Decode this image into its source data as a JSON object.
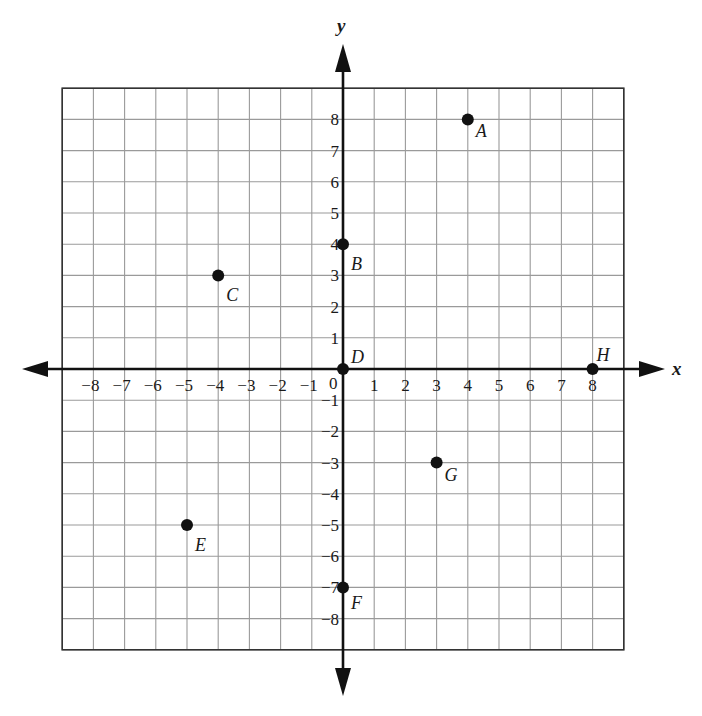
{
  "chart_data": {
    "type": "scatter",
    "title": "",
    "xlabel": "x",
    "ylabel": "y",
    "xlim": [
      -9,
      9
    ],
    "ylim": [
      -9,
      9
    ],
    "grid": true,
    "x_ticks": [
      -8,
      -7,
      -6,
      -5,
      -4,
      -3,
      -2,
      -1,
      0,
      1,
      2,
      3,
      4,
      5,
      6,
      7,
      8
    ],
    "y_ticks": [
      -8,
      -7,
      -6,
      -5,
      -4,
      -3,
      -2,
      -1,
      1,
      2,
      3,
      4,
      5,
      6,
      7,
      8
    ],
    "origin_label": "0",
    "points": [
      {
        "label": "A",
        "x": 4,
        "y": 8
      },
      {
        "label": "B",
        "x": 0,
        "y": 4
      },
      {
        "label": "C",
        "x": -4,
        "y": 3
      },
      {
        "label": "D",
        "x": 0,
        "y": 0
      },
      {
        "label": "E",
        "x": -5,
        "y": -5
      },
      {
        "label": "F",
        "x": 0,
        "y": -7
      },
      {
        "label": "G",
        "x": 3,
        "y": -3
      },
      {
        "label": "H",
        "x": 8,
        "y": 0
      }
    ],
    "colors": {
      "grid": "#9a9a9a",
      "border": "#333333",
      "axis": "#111111",
      "point": "#111111"
    }
  }
}
